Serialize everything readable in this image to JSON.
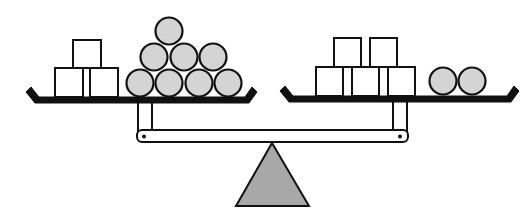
{
  "diagram": {
    "colors": {
      "stroke": "#111111",
      "ball_fill": "#d4d4d4",
      "block_fill": "#ffffff",
      "fulcrum_fill": "#a8a8a8",
      "background": "#ffffff"
    },
    "left_pan": {
      "blocks": [
        {
          "x": 55,
          "y": 68,
          "w": 28,
          "h": 29
        },
        {
          "x": 90,
          "y": 68,
          "w": 28,
          "h": 29
        },
        {
          "x": 73,
          "y": 40,
          "w": 28,
          "h": 28
        }
      ],
      "balls": [
        {
          "cx": 140,
          "cy": 83,
          "r": 13.5
        },
        {
          "cx": 169,
          "cy": 83,
          "r": 13.5
        },
        {
          "cx": 199,
          "cy": 83,
          "r": 13.5
        },
        {
          "cx": 228,
          "cy": 83,
          "r": 13.5
        },
        {
          "cx": 154,
          "cy": 57,
          "r": 13.5
        },
        {
          "cx": 184,
          "cy": 57,
          "r": 13.5
        },
        {
          "cx": 213,
          "cy": 57,
          "r": 13.5
        },
        {
          "cx": 169,
          "cy": 31,
          "r": 13.5
        }
      ],
      "block_count": 3,
      "ball_count": 8
    },
    "right_pan": {
      "blocks": [
        {
          "x": 316,
          "y": 67,
          "w": 27,
          "h": 29
        },
        {
          "x": 352,
          "y": 67,
          "w": 27,
          "h": 29
        },
        {
          "x": 388,
          "y": 67,
          "w": 27,
          "h": 29
        },
        {
          "x": 334,
          "y": 38,
          "w": 27,
          "h": 29
        },
        {
          "x": 370,
          "y": 38,
          "w": 27,
          "h": 29
        }
      ],
      "balls": [
        {
          "cx": 443,
          "cy": 81,
          "r": 13.5
        },
        {
          "cx": 472,
          "cy": 81,
          "r": 13.5
        }
      ],
      "block_count": 5,
      "ball_count": 2
    }
  }
}
